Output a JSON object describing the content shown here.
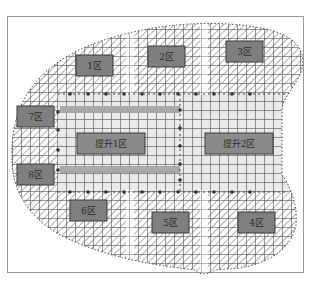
{
  "diagram": {
    "type": "construction-zoning-plan",
    "colors": {
      "frame": "#9a9a9a",
      "zone_box_fill": "#7f7f7f",
      "zone_box_border": "#3a3a3a",
      "lift_zone_fill": "#8a8a8a",
      "beam_band": "#a8a8a8",
      "grid_line": "#555555",
      "hatch": "#6a6a6a",
      "lift_area_bg": "#e6e6e6"
    },
    "zones": [
      {
        "id": "z1",
        "label": "1区",
        "x": 76,
        "y": 55,
        "w": 37,
        "h": 21
      },
      {
        "id": "z2",
        "label": "2区",
        "x": 148,
        "y": 46,
        "w": 37,
        "h": 21
      },
      {
        "id": "z3",
        "label": "3区",
        "x": 226,
        "y": 41,
        "w": 37,
        "h": 21
      },
      {
        "id": "z7",
        "label": "7区",
        "x": 17,
        "y": 106,
        "w": 37,
        "h": 21
      },
      {
        "id": "z8",
        "label": "8区",
        "x": 17,
        "y": 164,
        "w": 37,
        "h": 21
      },
      {
        "id": "z6",
        "label": "6区",
        "x": 70,
        "y": 200,
        "w": 37,
        "h": 21
      },
      {
        "id": "z5",
        "label": "5区",
        "x": 152,
        "y": 212,
        "w": 37,
        "h": 21
      },
      {
        "id": "z4",
        "label": "4区",
        "x": 238,
        "y": 212,
        "w": 37,
        "h": 21
      }
    ],
    "lift_zones": [
      {
        "id": "lift1",
        "label": "提升1区",
        "x": 77,
        "y": 133,
        "w": 68,
        "h": 21
      },
      {
        "id": "lift2",
        "label": "提升2区",
        "x": 205,
        "y": 133,
        "w": 68,
        "h": 21
      }
    ]
  }
}
